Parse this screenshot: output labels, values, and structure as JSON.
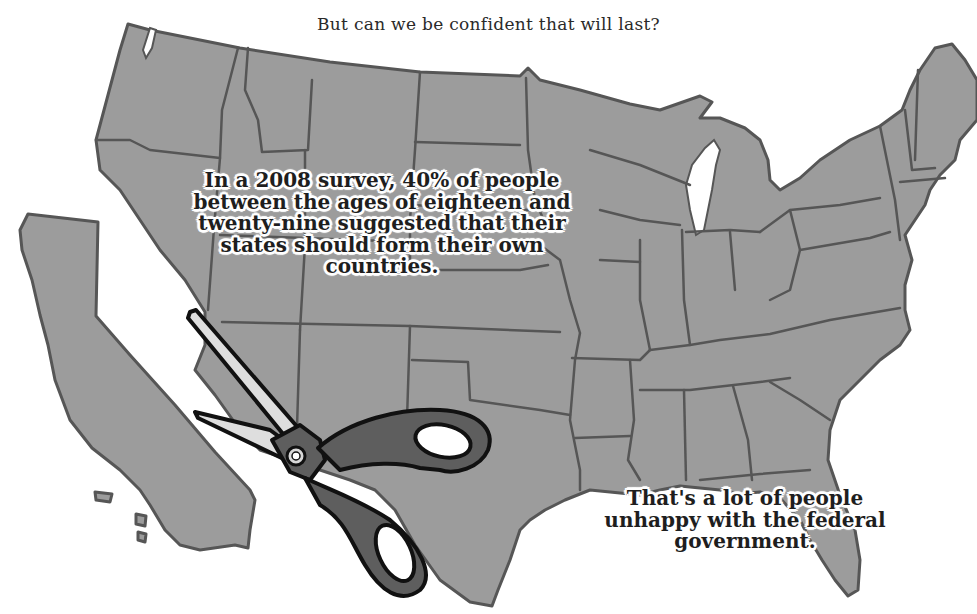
{
  "title": "But can we be confident that will last?",
  "captions": {
    "survey": "In a 2008 survey, 40% of people between the ages of eighteen and twenty-nine suggested that their states should form their own countries.",
    "unhappy": "That's a lot of people unhappy with the federal government."
  },
  "map": {
    "subject": "United States (contiguous 48 states)",
    "detached_state": "California",
    "illustration": "scissors-cutting-california",
    "colors": {
      "land": "#9c9c9c",
      "border": "#565656",
      "background": "#ffffff",
      "scissor_handle": "#5e5e5e",
      "scissor_blade": "#dedede"
    }
  }
}
